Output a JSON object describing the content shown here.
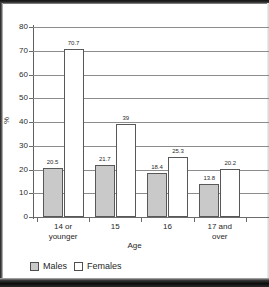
{
  "chart_data": {
    "type": "bar",
    "title": "",
    "xlabel": "Age",
    "ylabel": "%",
    "ylim": [
      0,
      80
    ],
    "yticks": [
      0,
      10,
      20,
      30,
      40,
      50,
      60,
      70,
      80
    ],
    "grid": true,
    "legend_position": "bottom-left",
    "categories": [
      "14 or younger",
      "15",
      "16",
      "17 and over"
    ],
    "category_lines": [
      [
        "14 or",
        "younger"
      ],
      [
        "15",
        ""
      ],
      [
        "16",
        ""
      ],
      [
        "17 and",
        "over"
      ]
    ],
    "series": [
      {
        "name": "Males",
        "color": "#c9c9c9",
        "values": [
          20.5,
          21.7,
          18.4,
          13.8
        ],
        "labels": [
          "20.5",
          "21.7",
          "18.4",
          "13.8"
        ]
      },
      {
        "name": "Females",
        "color": "#ffffff",
        "values": [
          70.7,
          39,
          25.3,
          20.2
        ],
        "labels": [
          "70.7",
          "39",
          "25.3",
          "20.2"
        ]
      }
    ]
  },
  "legend": {
    "items": [
      {
        "label": "Males",
        "swatch": "gray-square-icon"
      },
      {
        "label": "Females",
        "swatch": "white-square-icon"
      }
    ]
  }
}
